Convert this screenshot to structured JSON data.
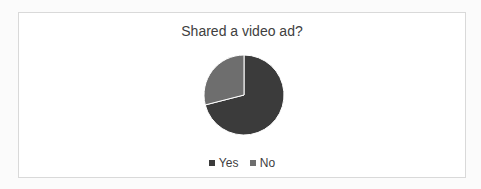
{
  "chart_data": {
    "type": "pie",
    "title": "Shared a video ad?",
    "categories": [
      "Yes",
      "No"
    ],
    "values": [
      71,
      29
    ],
    "colors": [
      "#3b3b3b",
      "#6e6e6e"
    ],
    "legend_position": "bottom",
    "start_angle_deg": 0,
    "direction": "clockwise"
  },
  "legend": {
    "items": [
      {
        "label": "Yes",
        "color": "#3b3b3b"
      },
      {
        "label": "No",
        "color": "#6e6e6e"
      }
    ]
  }
}
